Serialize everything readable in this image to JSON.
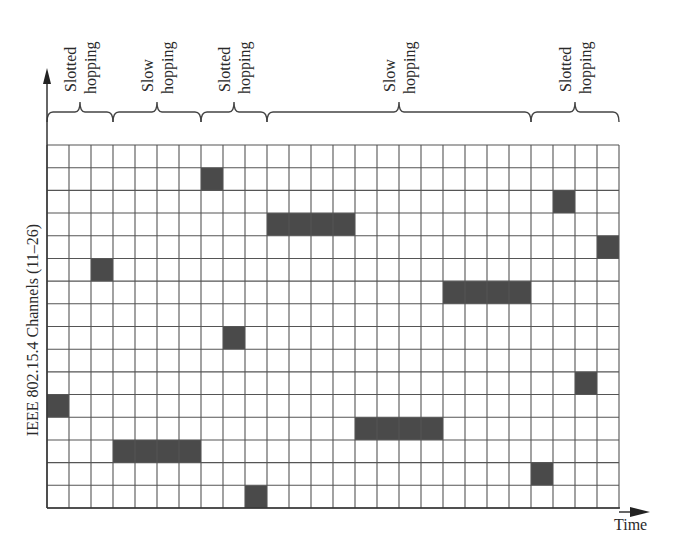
{
  "axes": {
    "y_label": "IEEE 802.15.4 Channels (11–26)",
    "x_label": "Time"
  },
  "grid": {
    "columns": 26,
    "rows": 16,
    "channel_range": [
      11,
      26
    ],
    "cell_fill": "#4a4a4a",
    "line_color": "#555555"
  },
  "segments": [
    {
      "mode_line1": "Slotted",
      "mode_line2": "hopping",
      "start_col": 0,
      "end_col": 3
    },
    {
      "mode_line1": "Slow",
      "mode_line2": "hopping",
      "start_col": 3,
      "end_col": 7
    },
    {
      "mode_line1": "Slotted",
      "mode_line2": "hopping",
      "start_col": 7,
      "end_col": 10
    },
    {
      "mode_line1": "Slow",
      "mode_line2": "hopping",
      "start_col": 10,
      "end_col": 22
    },
    {
      "mode_line1": "Slotted",
      "mode_line2": "hopping",
      "start_col": 22,
      "end_col": 26
    }
  ],
  "occupied_cells": [
    {
      "col": 0,
      "row": 11,
      "span": 1
    },
    {
      "col": 2,
      "row": 5,
      "span": 1
    },
    {
      "col": 3,
      "row": 13,
      "span": 4
    },
    {
      "col": 7,
      "row": 1,
      "span": 1
    },
    {
      "col": 8,
      "row": 8,
      "span": 1
    },
    {
      "col": 9,
      "row": 15,
      "span": 1
    },
    {
      "col": 10,
      "row": 3,
      "span": 4
    },
    {
      "col": 14,
      "row": 12,
      "span": 4
    },
    {
      "col": 18,
      "row": 6,
      "span": 4
    },
    {
      "col": 22,
      "row": 14,
      "span": 1
    },
    {
      "col": 23,
      "row": 2,
      "span": 1
    },
    {
      "col": 24,
      "row": 10,
      "span": 1
    },
    {
      "col": 25,
      "row": 4,
      "span": 1
    }
  ]
}
